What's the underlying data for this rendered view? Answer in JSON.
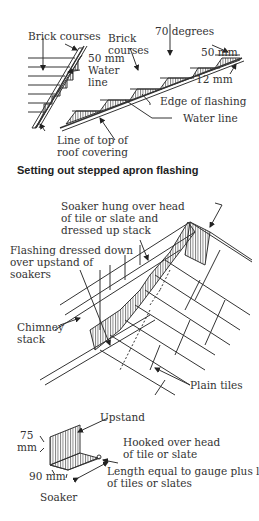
{
  "figure1": {
    "caption": "Setting out stepped apron flashing",
    "labels": {
      "brick_courses_left": "Brick courses",
      "brick_courses_right_1": "Brick",
      "brick_courses_right_2": "courses",
      "degrees": "70 degrees",
      "mm50_left": "50 mm",
      "mm50_right": "50 mm",
      "mm12": "12 mm",
      "water_line_left_1": "Water",
      "water_line_left_2": "line",
      "edge_of_flashing": "Edge of flashing",
      "water_line_right": "Water line",
      "roof_line_1": "Line of top of",
      "roof_line_2": "roof covering"
    }
  },
  "figure2": {
    "labels": {
      "soaker_1": "Soaker hung over head",
      "soaker_2": "of tile or slate and",
      "soaker_3": "dressed up stack",
      "flashing_1": "Flashing dressed down",
      "flashing_2": "over upstand of",
      "flashing_3": "soakers",
      "chimney_1": "Chimney",
      "chimney_2": "stack",
      "plain_tiles": "Plain tiles"
    }
  },
  "figure3": {
    "caption": "Soaker",
    "labels": {
      "upstand": "Upstand",
      "mm75_1": "75",
      "mm75_2": "mm",
      "mm90": "90 mm",
      "hooked_1": "Hooked over head",
      "hooked_2": "of tile or slate",
      "length_1": "Length equal to gauge plus lap",
      "length_2": "of tiles or slates"
    }
  }
}
